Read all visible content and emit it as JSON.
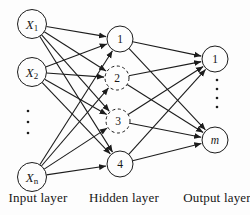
{
  "diagram": {
    "type": "neural-network",
    "canvas": {
      "width": 250,
      "height": 215
    },
    "colors": {
      "stroke": "#1c1c1c",
      "node_fill": "#fdfdfd",
      "text": "#161616",
      "background": "#fdfdfd"
    },
    "layers": [
      {
        "id": "input",
        "label": "Input layer"
      },
      {
        "id": "hidden",
        "label": "Hidden layer"
      },
      {
        "id": "output",
        "label": "Output layer"
      }
    ],
    "nodes": [
      {
        "id": "x1",
        "layer": "input",
        "label": "X",
        "sub": "1",
        "italic": true,
        "x": 32,
        "y": 24,
        "r": 14.5,
        "dashed": false
      },
      {
        "id": "x2",
        "layer": "input",
        "label": "X",
        "sub": "2",
        "italic": true,
        "x": 32,
        "y": 72,
        "r": 14.5,
        "dashed": false
      },
      {
        "id": "xn",
        "layer": "input",
        "label": "X",
        "sub": "n",
        "italic": true,
        "x": 32,
        "y": 177,
        "r": 14.5,
        "dashed": false
      },
      {
        "id": "h1",
        "layer": "hidden",
        "label": "1",
        "sub": "",
        "italic": false,
        "x": 120,
        "y": 39,
        "r": 13,
        "dashed": false
      },
      {
        "id": "h2",
        "layer": "hidden",
        "label": "2",
        "sub": "",
        "italic": false,
        "x": 117,
        "y": 78,
        "r": 12,
        "dashed": true
      },
      {
        "id": "h3",
        "layer": "hidden",
        "label": "3",
        "sub": "",
        "italic": false,
        "x": 118,
        "y": 121,
        "r": 12,
        "dashed": true
      },
      {
        "id": "h4",
        "layer": "hidden",
        "label": "4",
        "sub": "",
        "italic": false,
        "x": 120,
        "y": 164,
        "r": 13,
        "dashed": false
      },
      {
        "id": "o1",
        "layer": "output",
        "label": "1",
        "sub": "",
        "italic": false,
        "x": 215,
        "y": 59,
        "r": 13,
        "dashed": false
      },
      {
        "id": "om",
        "layer": "output",
        "label": "m",
        "sub": "",
        "italic": true,
        "x": 215,
        "y": 140,
        "r": 13,
        "dashed": false
      }
    ],
    "edges": [
      [
        "x1",
        "h1"
      ],
      [
        "x1",
        "h2"
      ],
      [
        "x1",
        "h3"
      ],
      [
        "x1",
        "h4"
      ],
      [
        "x2",
        "h1"
      ],
      [
        "x2",
        "h2"
      ],
      [
        "x2",
        "h3"
      ],
      [
        "x2",
        "h4"
      ],
      [
        "xn",
        "h1"
      ],
      [
        "xn",
        "h2"
      ],
      [
        "xn",
        "h3"
      ],
      [
        "xn",
        "h4"
      ],
      [
        "h1",
        "o1"
      ],
      [
        "h1",
        "om"
      ],
      [
        "h2",
        "o1"
      ],
      [
        "h2",
        "om"
      ],
      [
        "h3",
        "o1"
      ],
      [
        "h3",
        "om"
      ],
      [
        "h4",
        "o1"
      ],
      [
        "h4",
        "om"
      ]
    ],
    "ellipsis": [
      {
        "id": "input-ellipsis",
        "x": 28,
        "y_start": 111,
        "count": 3,
        "gap": 11
      },
      {
        "id": "output-ellipsis",
        "x": 217,
        "y_start": 80,
        "count": 4,
        "gap": 9
      }
    ]
  }
}
